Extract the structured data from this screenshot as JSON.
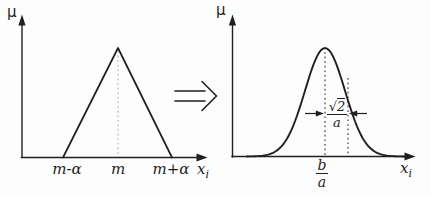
{
  "colors": {
    "background": "#fdfdfd",
    "ink": "#1f1f1f",
    "dotted_left": "#a8a8a8",
    "dotted_right": "#3c3c3c"
  },
  "left_plot": {
    "curve": "triangular-membership-function",
    "y_axis_label": "μ",
    "x_axis_label": "x",
    "x_axis_subscript": "i",
    "x_ticks": [
      {
        "label": "m-α"
      },
      {
        "label": "m"
      },
      {
        "label": "m+α"
      }
    ]
  },
  "transform": {
    "symbol": "implies-double-arrow"
  },
  "right_plot": {
    "curve": "gaussian-membership-function",
    "y_axis_label": "μ",
    "x_axis_label": "x",
    "x_axis_subscript": "i",
    "peak_position_label": {
      "numerator": "b",
      "denominator": "a"
    },
    "width_annotation": {
      "radical": "√",
      "radicand": "2",
      "denominator": "a"
    }
  }
}
